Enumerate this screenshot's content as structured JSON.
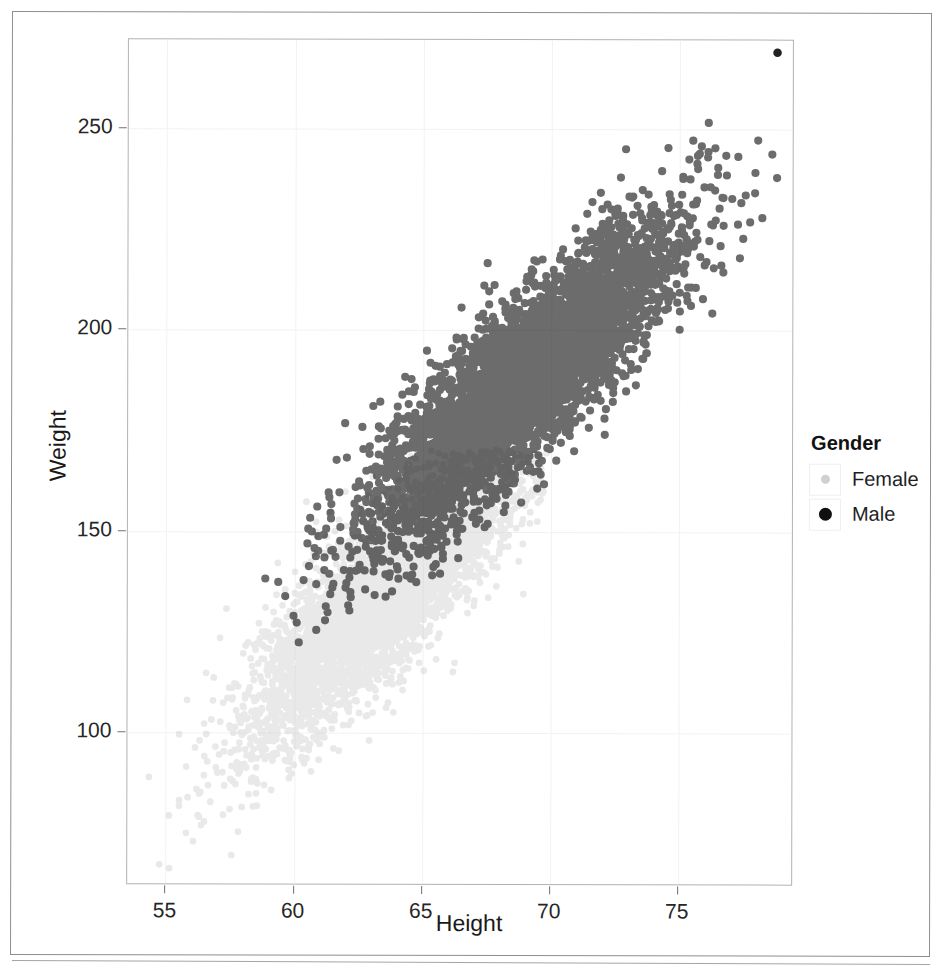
{
  "figure": {
    "caption": "",
    "background_color": "#ffffff",
    "frame_color": "#8e8e8e"
  },
  "chart_data": {
    "type": "scatter",
    "title": "",
    "xlabel": "Height",
    "ylabel": "Weight",
    "xlim": [
      53.5,
      79.5
    ],
    "ylim": [
      62,
      272
    ],
    "xticks": [
      55,
      60,
      65,
      70,
      75
    ],
    "yticks": [
      100,
      150,
      200,
      250
    ],
    "grid": true,
    "legend": {
      "title": "Gender",
      "position": "right",
      "entries": [
        {
          "label": "Female",
          "color": "#c9c9c9",
          "marker": "circle"
        },
        {
          "label": "Male",
          "color": "#121212",
          "marker": "circle"
        }
      ]
    },
    "series": [
      {
        "name": "Female",
        "color": "#c9c9c9",
        "n_points": 5000,
        "x_mean": 63.7,
        "x_sd": 2.7,
        "y_mean": 135.9,
        "y_sd": 19.0,
        "correlation": 0.85,
        "x_range": [
          54.3,
          69.9
        ],
        "y_range": [
          64.7,
          170.0
        ]
      },
      {
        "name": "Male",
        "color": "#121212",
        "n_points": 5000,
        "x_mean": 69.0,
        "x_sd": 2.9,
        "y_mean": 187.0,
        "y_sd": 19.4,
        "correlation": 0.86,
        "x_range": [
          58.4,
          79.0
        ],
        "y_range": [
          112.9,
          269.0
        ]
      }
    ]
  },
  "axes": {
    "y": {
      "title": "Weight",
      "ticks": [
        {
          "value": 250,
          "label": "250"
        },
        {
          "value": 200,
          "label": "200"
        },
        {
          "value": 150,
          "label": "150"
        },
        {
          "value": 100,
          "label": "100"
        }
      ]
    },
    "x": {
      "title": "Height",
      "ticks": [
        {
          "value": 55,
          "label": "55"
        },
        {
          "value": 60,
          "label": "60"
        },
        {
          "value": 65,
          "label": "65"
        },
        {
          "value": 70,
          "label": "70"
        },
        {
          "value": 75,
          "label": "75"
        }
      ]
    }
  },
  "legend": {
    "title": "Gender",
    "items": [
      {
        "label": "Female"
      },
      {
        "label": "Male"
      }
    ]
  }
}
